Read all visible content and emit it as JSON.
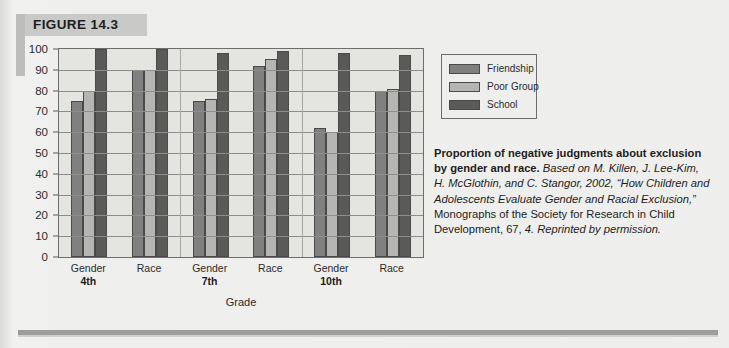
{
  "figure": {
    "tag": "FIGURE 14.3"
  },
  "legend": {
    "items": [
      {
        "label": "Friendship",
        "color": "#808080"
      },
      {
        "label": "Poor Group",
        "color": "#b5b5b3"
      },
      {
        "label": "School",
        "color": "#5a5a58"
      }
    ]
  },
  "caption": {
    "title": "Proportion of negative judgments about exclusion by gender and race.",
    "source_part1": " Based on M. Killen, J. Lee-Kim, H. McGlothin, and C. Stangor, 2002, “How Children and Adolescents Evaluate Gender and Racial Exclusion,”",
    "source_part2": " Monographs of the Society for Research in Child Development, 67,",
    "source_part3": " 4. Reprinted by permission."
  },
  "chart_data": {
    "type": "bar",
    "title": "",
    "xlabel": "Grade",
    "ylabel": "",
    "ylim": [
      0,
      100
    ],
    "yticks": [
      0,
      10,
      20,
      30,
      40,
      50,
      60,
      70,
      80,
      90,
      100
    ],
    "grid": true,
    "legend_position": "right",
    "categories": [
      "Gender",
      "Race",
      "Gender",
      "Race",
      "Gender",
      "Race"
    ],
    "group_labels": [
      "4th",
      "4th",
      "7th",
      "7th",
      "10th",
      "10th"
    ],
    "grade_spans": [
      {
        "grade": "4th",
        "categories": [
          "Gender",
          "Race"
        ]
      },
      {
        "grade": "7th",
        "categories": [
          "Gender",
          "Race"
        ]
      },
      {
        "grade": "10th",
        "categories": [
          "Gender",
          "Race"
        ]
      }
    ],
    "series": [
      {
        "name": "Friendship",
        "color": "#808080",
        "values": [
          75,
          90,
          75,
          92,
          62,
          80
        ]
      },
      {
        "name": "Poor Group",
        "color": "#b5b5b3",
        "values": [
          80,
          90,
          76,
          95,
          60,
          81
        ]
      },
      {
        "name": "School",
        "color": "#5a5a58",
        "values": [
          100,
          100,
          98,
          99,
          98,
          97
        ]
      }
    ]
  }
}
